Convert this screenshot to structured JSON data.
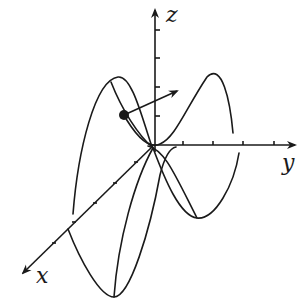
{
  "diagram": {
    "type": "3d-parametric-curve",
    "axes": {
      "x": {
        "label": "x",
        "ticks": 5
      },
      "y": {
        "label": "y",
        "ticks": 4
      },
      "z": {
        "label": "z",
        "ticks": 4
      }
    },
    "point": {
      "shape": "filled-dot"
    },
    "vector": {
      "from": "point",
      "direction": "tangent"
    },
    "colors": {
      "stroke": "#1a1a1a",
      "background": "#ffffff"
    }
  }
}
